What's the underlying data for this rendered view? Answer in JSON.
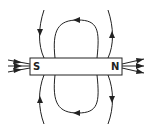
{
  "diagram": {
    "magnet": {
      "south_label": "S",
      "north_label": "N"
    },
    "colors": {
      "line": "#222222",
      "background": "#ffffff",
      "magnet_fill": "#ffffff"
    }
  }
}
